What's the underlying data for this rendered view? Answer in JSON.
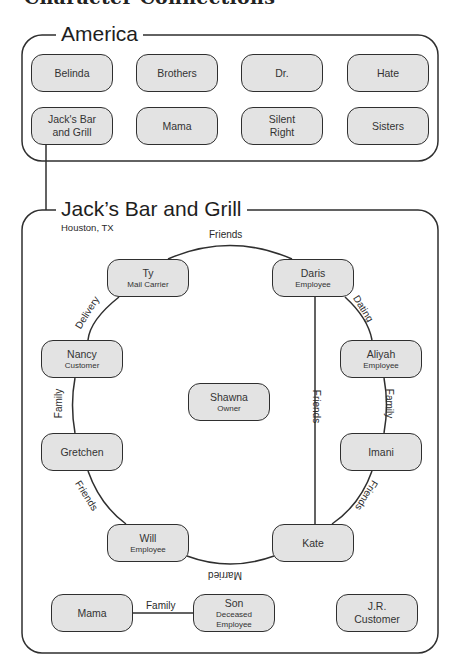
{
  "page_title": "Character Connections",
  "groups": {
    "america": {
      "title": "America",
      "items": [
        {
          "label": "Belinda"
        },
        {
          "label": "Brothers"
        },
        {
          "label": "Dr."
        },
        {
          "label": "Hate"
        },
        {
          "label": "Jack's Bar\nand Grill"
        },
        {
          "label": "Mama"
        },
        {
          "label": "Silent\nRight"
        },
        {
          "label": "Sisters"
        }
      ]
    },
    "jacks": {
      "title": "Jack’s Bar and Grill",
      "subtitle": "Houston, TX",
      "characters": {
        "ty": {
          "name": "Ty",
          "role": "Mail Carrier"
        },
        "daris": {
          "name": "Daris",
          "role": "Employee"
        },
        "nancy": {
          "name": "Nancy",
          "role": "Customer"
        },
        "aliyah": {
          "name": "Aliyah",
          "role": "Employee"
        },
        "shawna": {
          "name": "Shawna",
          "role": "Owner"
        },
        "gretchen": {
          "name": "Gretchen"
        },
        "imani": {
          "name": "Imani"
        },
        "will": {
          "name": "Will",
          "role": "Employee"
        },
        "kate": {
          "name": "Kate"
        },
        "mama": {
          "name": "Mama"
        },
        "son": {
          "name": "Son",
          "role": "Deceased\nEmployee"
        },
        "jr": {
          "name": "J.R.",
          "role": "Customer"
        }
      },
      "relationships": {
        "ty_daris": "Friends",
        "ty_nancy": "Delivery",
        "daris_aliyah": "Dating",
        "daris_kate": "Friends",
        "nancy_gretchen": "Family",
        "aliyah_imani": "Family",
        "gretchen_will": "Friends",
        "imani_kate": "Friends",
        "will_kate": "Married",
        "mama_son": "Family"
      }
    }
  },
  "colors": {
    "node_fill": "#e3e3e3",
    "stroke": "#2f2f2f",
    "background": "#ffffff"
  }
}
